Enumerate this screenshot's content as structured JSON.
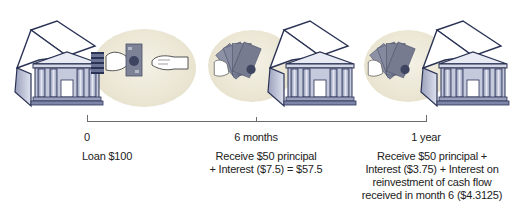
{
  "diagram": {
    "type": "timeline",
    "points": [
      {
        "time_label": "0",
        "description_lines": [
          "Loan $100"
        ]
      },
      {
        "time_label": "6 months",
        "description_lines": [
          "Receive $50 principal",
          "+ Interest ($7.5) = $57.5"
        ]
      },
      {
        "time_label": "1 year",
        "description_lines": [
          "Receive $50 principal +",
          "Interest ($3.75) + Interest on",
          "reinvestment of cash flow",
          "received in month 6 ($4.3125)"
        ]
      }
    ],
    "icons": [
      "bank-icon",
      "handing-money-icon",
      "open-hand-icon",
      "bank-icon",
      "fanned-cash-icon",
      "bank-icon",
      "fanned-cash-icon"
    ]
  },
  "colors": {
    "bank_outline": "#2b3355",
    "bank_fill": "#c9cde0",
    "oval_fill": "#ebe6d3",
    "cash_fill": "#7d8296",
    "line": "#6b6b6b"
  }
}
